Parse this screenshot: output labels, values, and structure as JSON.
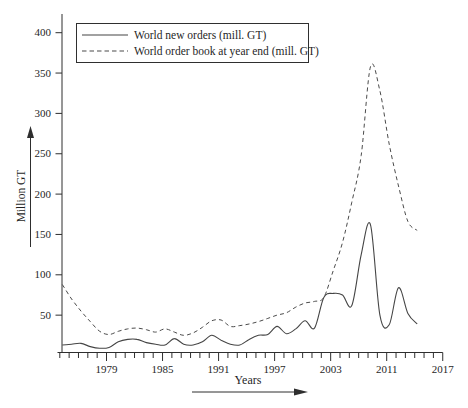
{
  "figure": {
    "background": "#ffffff",
    "text_color": "#1f1f1f",
    "axis_color": "#2e2e2e",
    "solid_line_color": "#454545",
    "dashed_line_color": "#4b4b4b"
  },
  "legend": {
    "items": [
      {
        "label": "World new orders (mill. GT)",
        "style": "solid"
      },
      {
        "label": "World order book at year end (mill. GT)",
        "style": "dashed"
      }
    ]
  },
  "chart_data": {
    "type": "line",
    "title": "",
    "xlabel": "Years",
    "ylabel": "Million GT",
    "ylim": [
      0,
      420
    ],
    "y_ticks": [
      50,
      100,
      150,
      200,
      250,
      300,
      350,
      400
    ],
    "grid": false,
    "legend_position": "top-left",
    "x_tick_labels": [
      "1979",
      "1985",
      "1991",
      "1997",
      "2003",
      "2011",
      "2017"
    ],
    "x_label_tick_indices": [
      5,
      11,
      17,
      23,
      29,
      35,
      41
    ],
    "x_minor_tick_count": 42,
    "x": [
      1974,
      1975,
      1976,
      1977,
      1978,
      1979,
      1980,
      1981,
      1982,
      1983,
      1984,
      1985,
      1986,
      1987,
      1988,
      1989,
      1990,
      1991,
      1992,
      1993,
      1994,
      1995,
      1996,
      1997,
      1998,
      1999,
      2000,
      2001,
      2002,
      2003,
      2004,
      2005,
      2006,
      2007,
      2008,
      2009,
      2010,
      2011,
      2012
    ],
    "series": [
      {
        "id": "new_orders",
        "name": "World new orders (mill. GT)",
        "style": "solid",
        "values": [
          13,
          14,
          15,
          11,
          9,
          10,
          17,
          20,
          20,
          16,
          14,
          13,
          21,
          14,
          13,
          17,
          25,
          19,
          14,
          13,
          20,
          25,
          26,
          36,
          27,
          33,
          43,
          34,
          72,
          77,
          75,
          62,
          125,
          162,
          50,
          38,
          84,
          52,
          39
        ]
      },
      {
        "id": "order_book",
        "name": "World order book at year end (mill. GT)",
        "style": "dashed",
        "values": [
          88,
          70,
          55,
          42,
          30,
          26,
          30,
          33,
          34,
          32,
          29,
          33,
          29,
          25,
          28,
          35,
          43,
          44,
          36,
          37,
          39,
          42,
          46,
          50,
          53,
          60,
          65,
          67,
          72,
          105,
          140,
          190,
          248,
          358,
          328,
          262,
          210,
          166,
          155
        ]
      }
    ]
  }
}
